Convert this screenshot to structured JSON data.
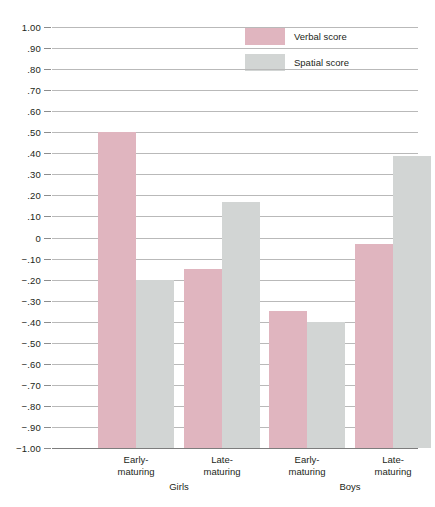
{
  "chart_data": {
    "type": "bar",
    "title": "",
    "subtitle": "",
    "xlabel": "",
    "ylabel": "",
    "ylim": [
      -1.0,
      1.0
    ],
    "grid": true,
    "legend_position": "top-right",
    "categories": [
      "Early-\nmaturing",
      "Late-\nmaturing",
      "Early-\nmaturing",
      "Late-\nmaturing"
    ],
    "group_labels": [
      "Girls",
      "Boys"
    ],
    "y_ticks": [
      "1.00",
      ".90",
      ".80",
      ".70",
      ".60",
      ".50",
      ".40",
      ".30",
      ".20",
      ".10",
      "0",
      "−.10",
      "−.20",
      "−.30",
      "−.40",
      "−.50",
      "−.60",
      "−.70",
      "−.80",
      "−.90",
      "−1.00"
    ],
    "y_tick_values": [
      1.0,
      0.9,
      0.8,
      0.7,
      0.6,
      0.5,
      0.4,
      0.3,
      0.2,
      0.1,
      0,
      -0.1,
      -0.2,
      -0.3,
      -0.4,
      -0.5,
      -0.6,
      -0.7,
      -0.8,
      -0.9,
      -1.0
    ],
    "series": [
      {
        "name": "Verbal score",
        "color": "#e0b5bf",
        "values": [
          0.5,
          -0.15,
          -0.35,
          -0.03
        ]
      },
      {
        "name": "Spatial score",
        "color": "#d2d5d4",
        "values": [
          -0.2,
          0.17,
          -0.4,
          0.385
        ]
      }
    ]
  },
  "legend": {
    "items": [
      {
        "label": "Verbal score",
        "swatch": "verbal-swatch"
      },
      {
        "label": "Spatial score",
        "swatch": "spatial-swatch"
      }
    ]
  },
  "colors": {
    "verbal": "#e0b5bf",
    "spatial": "#d2d5d4",
    "gridline": "#b9b9b9",
    "baseline": "#7d7d7d",
    "text": "#231f20",
    "background": "#ffffff"
  }
}
